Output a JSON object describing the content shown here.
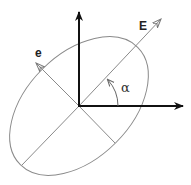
{
  "diagram": {
    "type": "polarization-ellipse",
    "labels": {
      "major_axis_vector": "E",
      "minor_axis_vector": "e",
      "angle": "α"
    },
    "geometry": {
      "origin": [
        79,
        106
      ],
      "ellipse_rotation_deg": -45,
      "semi_major_px": 83,
      "semi_minor_px": 52,
      "vertical_axis_tip": [
        79,
        12
      ],
      "horizontal_axis_tip": [
        183,
        106
      ],
      "E_arrow_tip": [
        161,
        19
      ],
      "e_arrow_tip": [
        36,
        63
      ],
      "major_axis_lower_end": [
        22,
        165
      ],
      "minor_axis_lower_end": [
        115,
        143
      ]
    },
    "colors": {
      "axes": "#111111",
      "ellipse": "#888888",
      "lines": "#888888",
      "text": "#222222"
    }
  }
}
